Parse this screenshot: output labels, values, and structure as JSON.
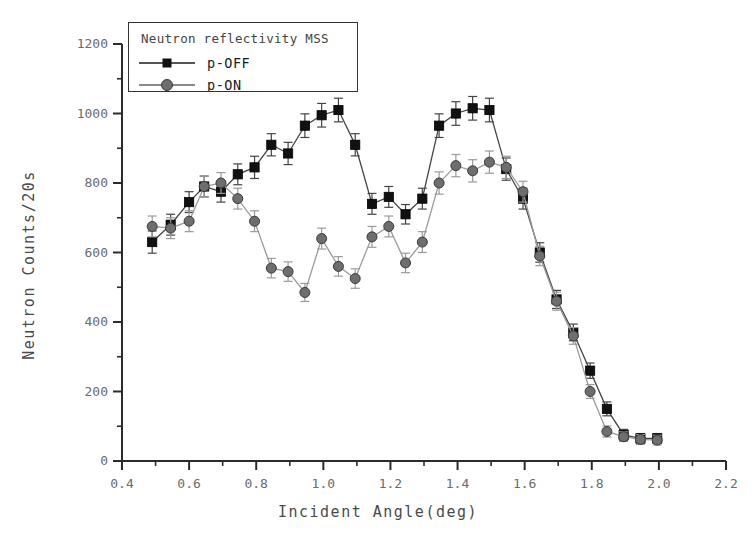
{
  "chart_data": {
    "type": "scatter",
    "title": "Neutron reflectivity MSS",
    "xlabel": "Incident Angle(deg)",
    "ylabel": "Neutron Counts/20s",
    "xlim": [
      0.4,
      2.2
    ],
    "ylim": [
      0,
      1200
    ],
    "xticks": [
      0.4,
      0.6,
      0.8,
      1.0,
      1.2,
      1.4,
      1.6,
      1.8,
      2.0,
      2.2
    ],
    "xtick_labels": [
      "0.4",
      "0.6",
      "0.8",
      "1.0",
      "1.2",
      "1.4",
      "1.6",
      "1.8",
      "2.0",
      "2.2"
    ],
    "yticks": [
      0,
      200,
      400,
      600,
      800,
      1000,
      1200
    ],
    "ytick_labels": [
      "0",
      "200",
      "400",
      "600",
      "800",
      "1000",
      "1200"
    ],
    "x_minor_step": 0.1,
    "y_minor_step": 100,
    "grid": false,
    "legend_position": "top-left",
    "series": [
      {
        "name": "p-OFF",
        "marker": "square",
        "color": "#111111",
        "line_color": "#444444",
        "x": [
          0.49,
          0.545,
          0.6,
          0.645,
          0.695,
          0.745,
          0.795,
          0.845,
          0.895,
          0.945,
          0.995,
          1.045,
          1.095,
          1.145,
          1.195,
          1.245,
          1.295,
          1.345,
          1.395,
          1.445,
          1.495,
          1.545,
          1.595,
          1.645,
          1.695,
          1.745,
          1.795,
          1.845,
          1.895,
          1.945,
          1.995
        ],
        "y": [
          630,
          680,
          745,
          790,
          775,
          825,
          845,
          910,
          885,
          965,
          995,
          1010,
          910,
          740,
          760,
          710,
          755,
          965,
          1000,
          1015,
          1010,
          840,
          755,
          600,
          465,
          370,
          260,
          150,
          75,
          65,
          65
        ],
        "yerr": [
          32,
          30,
          30,
          30,
          30,
          30,
          32,
          32,
          32,
          34,
          34,
          34,
          32,
          30,
          30,
          28,
          30,
          34,
          34,
          34,
          34,
          32,
          30,
          28,
          26,
          24,
          22,
          20,
          16,
          14,
          14
        ]
      },
      {
        "name": "p-ON",
        "marker": "circle",
        "color": "#6e6e6e",
        "line_color": "#9a9a9a",
        "x": [
          0.49,
          0.545,
          0.6,
          0.645,
          0.695,
          0.745,
          0.795,
          0.845,
          0.895,
          0.945,
          0.995,
          1.045,
          1.095,
          1.145,
          1.195,
          1.245,
          1.295,
          1.345,
          1.395,
          1.445,
          1.495,
          1.545,
          1.595,
          1.645,
          1.695,
          1.745,
          1.795,
          1.845,
          1.895,
          1.945,
          1.995
        ],
        "y": [
          675,
          670,
          690,
          790,
          800,
          755,
          690,
          555,
          545,
          485,
          640,
          560,
          525,
          645,
          675,
          570,
          630,
          800,
          850,
          835,
          860,
          845,
          775,
          590,
          460,
          360,
          200,
          85,
          70,
          62,
          60
        ],
        "yerr": [
          30,
          30,
          30,
          30,
          30,
          30,
          30,
          28,
          28,
          26,
          30,
          28,
          28,
          30,
          30,
          28,
          30,
          32,
          32,
          32,
          32,
          32,
          30,
          28,
          26,
          24,
          20,
          16,
          14,
          14,
          14
        ]
      }
    ]
  },
  "legend": {
    "title": "Neutron reflectivity MSS",
    "entries": [
      {
        "label": "p-OFF",
        "marker": "square-marker",
        "color": "#111111"
      },
      {
        "label": "p-ON",
        "marker": "circle-marker",
        "color": "#6e6e6e"
      }
    ]
  },
  "axes": {
    "x_title": "Incident Angle(deg)",
    "y_title": "Neutron Counts/20s"
  }
}
